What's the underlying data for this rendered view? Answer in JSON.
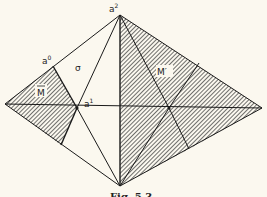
{
  "figure": {
    "caption": "Fig. 5.3",
    "labels": {
      "a0": "a",
      "a0_sup": "0",
      "a1": "a",
      "a1_sup": "1",
      "a2": "a",
      "a2_sup": "2",
      "sigma": "σ",
      "m_bar": "M",
      "m_prime": "M′"
    },
    "colors": {
      "line": "#1a1a1a",
      "hatch": "#333333",
      "paper": "#fbf8ef"
    }
  }
}
